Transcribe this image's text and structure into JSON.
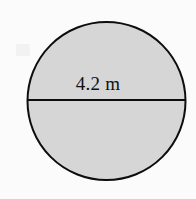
{
  "figure": {
    "shape_type": "circle",
    "label": "4.2 m",
    "label_value": "4.2",
    "label_unit": "m",
    "measurement_of": "diameter"
  },
  "geometry": {
    "center_x": 106.5,
    "center_y": 101,
    "radius": 79,
    "diameter_px": 158,
    "diameter_line_y": 100,
    "diameter_line_x1": 27,
    "diameter_line_x2": 186,
    "stroke_width": 2
  },
  "colors": {
    "background": "#fbfbfb",
    "fill": "#d6d6d6",
    "stroke": "#0d0d0d",
    "text": "#111111"
  },
  "icons": {
    "circle": "circle-outline-icon",
    "diameter": "diameter-line-icon"
  }
}
